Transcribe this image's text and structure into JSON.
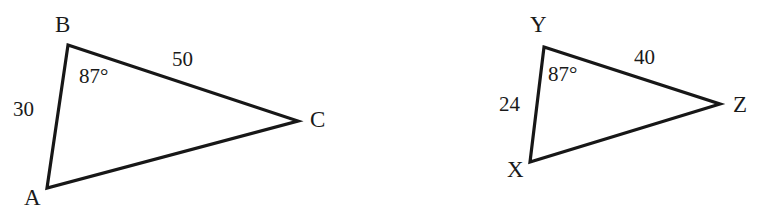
{
  "figure": {
    "stroke_color": "#171717",
    "background_color": "#ffffff",
    "text_color": "#1a1a1a",
    "width": 773,
    "height": 210,
    "triangles": [
      {
        "name": "triangle-abc",
        "vertices": [
          {
            "label": "B",
            "x": 68,
            "y": 45,
            "label_x": 55,
            "label_y": 13
          },
          {
            "label": "C",
            "x": 298,
            "y": 121,
            "label_x": 310,
            "label_y": 108
          },
          {
            "label": "A",
            "x": 47,
            "y": 188,
            "label_x": 24,
            "label_y": 186
          }
        ],
        "sides": [
          {
            "name": "side-bc",
            "value": "50",
            "label_x": 172,
            "label_y": 49
          },
          {
            "name": "side-ab",
            "value": "30",
            "label_x": 13,
            "label_y": 99
          }
        ],
        "angles": [
          {
            "name": "angle-b",
            "value": "87°",
            "label_x": 79,
            "label_y": 66
          }
        ]
      },
      {
        "name": "triangle-xyz",
        "vertices": [
          {
            "label": "Y",
            "x": 544,
            "y": 47,
            "label_x": 530,
            "label_y": 13
          },
          {
            "label": "Z",
            "x": 720,
            "y": 104,
            "label_x": 733,
            "label_y": 93
          },
          {
            "label": "X",
            "x": 530,
            "y": 162,
            "label_x": 507,
            "label_y": 158
          }
        ],
        "sides": [
          {
            "name": "side-yz",
            "value": "40",
            "label_x": 634,
            "label_y": 47
          },
          {
            "name": "side-xy",
            "value": "24",
            "label_x": 499,
            "label_y": 94
          }
        ],
        "angles": [
          {
            "name": "angle-y",
            "value": "87°",
            "label_x": 548,
            "label_y": 64
          }
        ]
      }
    ]
  }
}
